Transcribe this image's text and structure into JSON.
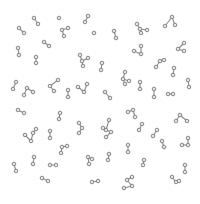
{
  "image": {
    "width": 200,
    "height": 204,
    "background": "#ffffff",
    "description": "Scattered ball-and-stick molecule glyphs on a white background",
    "colors": {
      "atom_fill": "#e6e6e6",
      "atom_stroke": "#7a7a7a",
      "bond": "#8a8a8a"
    },
    "atom_radius": 1.8
  },
  "molecules": [
    {
      "atoms": [
        [
          34,
          18
        ],
        [
          38,
          24
        ]
      ],
      "bonds": [
        [
          0,
          1
        ]
      ]
    },
    {
      "atoms": [
        [
          19,
          28
        ],
        [
          24,
          33
        ]
      ],
      "bonds": [
        [
          0,
          1
        ]
      ]
    },
    {
      "atoms": [
        [
          59,
          18
        ]
      ],
      "bonds": []
    },
    {
      "atoms": [
        [
          62,
          30
        ],
        [
          68,
          28
        ],
        [
          64,
          36
        ]
      ],
      "bonds": [
        [
          0,
          1
        ],
        [
          0,
          2
        ]
      ]
    },
    {
      "atoms": [
        [
          88,
          16
        ],
        [
          85,
          22
        ]
      ],
      "bonds": [
        [
          0,
          1
        ]
      ]
    },
    {
      "atoms": [
        [
          94,
          33
        ]
      ],
      "bonds": []
    },
    {
      "atoms": [
        [
          44,
          42
        ],
        [
          49,
          46
        ]
      ],
      "bonds": [
        [
          0,
          1
        ]
      ]
    },
    {
      "atoms": [
        [
          18,
          48
        ],
        [
          19,
          55
        ]
      ],
      "bonds": [
        [
          0,
          1
        ]
      ]
    },
    {
      "atoms": [
        [
          36,
          57
        ],
        [
          36,
          63
        ]
      ],
      "bonds": [
        [
          0,
          1
        ]
      ]
    },
    {
      "atoms": [
        [
          82,
          61
        ],
        [
          80,
          55
        ],
        [
          88,
          58
        ],
        [
          83,
          66
        ]
      ],
      "bonds": [
        [
          0,
          1
        ],
        [
          0,
          2
        ],
        [
          0,
          3
        ]
      ]
    },
    {
      "atoms": [
        [
          16,
          82
        ],
        [
          13,
          89
        ]
      ],
      "bonds": [
        [
          0,
          1
        ]
      ]
    },
    {
      "atoms": [
        [
          27,
          88
        ],
        [
          24,
          95
        ],
        [
          33,
          92
        ]
      ],
      "bonds": [
        [
          0,
          1
        ],
        [
          0,
          2
        ]
      ]
    },
    {
      "atoms": [
        [
          50,
          86
        ],
        [
          58,
          80
        ],
        [
          54,
          91
        ]
      ],
      "bonds": [
        [
          0,
          1
        ],
        [
          0,
          2
        ]
      ]
    },
    {
      "atoms": [
        [
          68,
          90
        ],
        [
          68,
          97
        ]
      ],
      "bonds": [
        [
          0,
          1
        ]
      ]
    },
    {
      "atoms": [
        [
          78,
          87
        ],
        [
          84,
          92
        ],
        [
          87,
          84
        ]
      ],
      "bonds": [
        [
          0,
          1
        ],
        [
          1,
          2
        ]
      ]
    },
    {
      "atoms": [
        [
          114,
          31
        ],
        [
          116,
          38
        ]
      ],
      "bonds": [
        [
          0,
          1
        ]
      ]
    },
    {
      "atoms": [
        [
          140,
          29
        ],
        [
          137,
          24
        ],
        [
          147,
          30
        ],
        [
          141,
          33
        ]
      ],
      "bonds": [
        [
          0,
          1
        ],
        [
          0,
          2
        ],
        [
          0,
          3
        ]
      ]
    },
    {
      "atoms": [
        [
          172,
          17
        ],
        [
          165,
          26
        ],
        [
          175,
          25
        ]
      ],
      "bonds": [
        [
          0,
          1
        ],
        [
          0,
          2
        ]
      ]
    },
    {
      "atoms": [
        [
          141,
          54
        ],
        [
          134,
          51
        ],
        [
          141,
          46
        ]
      ],
      "bonds": [
        [
          0,
          1
        ],
        [
          0,
          2
        ]
      ]
    },
    {
      "atoms": [
        [
          184,
          43
        ],
        [
          178,
          49
        ],
        [
          184,
          51
        ]
      ],
      "bonds": [
        [
          0,
          1
        ],
        [
          1,
          2
        ]
      ]
    },
    {
      "atoms": [
        [
          160,
          61
        ],
        [
          164,
          60
        ],
        [
          156,
          67
        ]
      ],
      "bonds": [
        [
          0,
          1
        ],
        [
          0,
          2
        ]
      ]
    },
    {
      "atoms": [
        [
          102,
          63
        ],
        [
          101,
          70
        ]
      ],
      "bonds": [
        [
          0,
          1
        ]
      ]
    },
    {
      "atoms": [
        [
          125,
          72
        ],
        [
          123,
          79
        ],
        [
          129,
          81
        ],
        [
          125,
          84
        ]
      ],
      "bonds": [
        [
          0,
          1
        ],
        [
          1,
          2
        ],
        [
          1,
          3
        ]
      ]
    },
    {
      "atoms": [
        [
          140,
          82
        ],
        [
          140,
          89
        ]
      ],
      "bonds": [
        [
          0,
          1
        ]
      ]
    },
    {
      "atoms": [
        [
          174,
          68
        ],
        [
          173,
          75
        ]
      ],
      "bonds": [
        [
          0,
          1
        ]
      ]
    },
    {
      "atoms": [
        [
          188,
          80
        ],
        [
          189,
          87
        ]
      ],
      "bonds": [
        [
          0,
          1
        ]
      ]
    },
    {
      "atoms": [
        [
          105,
          92
        ],
        [
          110,
          98
        ]
      ],
      "bonds": [
        [
          0,
          1
        ]
      ]
    },
    {
      "atoms": [
        [
          154,
          89
        ],
        [
          154,
          97
        ]
      ],
      "bonds": [
        [
          0,
          1
        ]
      ]
    },
    {
      "atoms": [
        [
          168,
          94
        ],
        [
          173,
          94
        ]
      ],
      "bonds": [
        [
          0,
          1
        ]
      ]
    },
    {
      "atoms": [
        [
          18,
          110
        ],
        [
          24,
          113
        ]
      ],
      "bonds": [
        [
          0,
          1
        ]
      ]
    },
    {
      "atoms": [
        [
          60,
          113
        ],
        [
          59,
          119
        ]
      ],
      "bonds": [
        [
          0,
          1
        ]
      ]
    },
    {
      "atoms": [
        [
          79,
          123
        ],
        [
          82,
          128
        ],
        [
          79,
          133
        ]
      ],
      "bonds": [
        [
          0,
          1
        ],
        [
          1,
          2
        ]
      ]
    },
    {
      "atoms": [
        [
          31,
          141
        ],
        [
          25,
          135
        ],
        [
          33,
          133
        ],
        [
          36,
          129
        ]
      ],
      "bonds": [
        [
          0,
          1
        ],
        [
          0,
          2
        ],
        [
          2,
          3
        ]
      ]
    },
    {
      "atoms": [
        [
          50,
          131
        ],
        [
          50,
          138
        ]
      ],
      "bonds": [
        [
          0,
          1
        ]
      ]
    },
    {
      "atoms": [
        [
          62,
          147
        ],
        [
          67,
          146
        ],
        [
          61,
          153
        ]
      ],
      "bonds": [
        [
          0,
          1
        ],
        [
          0,
          2
        ]
      ]
    },
    {
      "atoms": [
        [
          14,
          164
        ],
        [
          16,
          171
        ]
      ],
      "bonds": [
        [
          0,
          1
        ]
      ]
    },
    {
      "atoms": [
        [
          34,
          157
        ],
        [
          33,
          164
        ]
      ],
      "bonds": [
        [
          0,
          1
        ]
      ]
    },
    {
      "atoms": [
        [
          50,
          165
        ],
        [
          56,
          165
        ]
      ],
      "bonds": [
        [
          0,
          1
        ]
      ]
    },
    {
      "atoms": [
        [
          88,
          157
        ],
        [
          92,
          159
        ],
        [
          89,
          164
        ]
      ],
      "bonds": [
        [
          0,
          1
        ],
        [
          0,
          2
        ]
      ]
    },
    {
      "atoms": [
        [
          42,
          178
        ],
        [
          48,
          181
        ]
      ],
      "bonds": [
        [
          0,
          1
        ]
      ]
    },
    {
      "atoms": [
        [
          92,
          182
        ],
        [
          98,
          181
        ]
      ],
      "bonds": [
        [
          0,
          1
        ]
      ]
    },
    {
      "atoms": [
        [
          128,
          112
        ],
        [
          133,
          110
        ],
        [
          135,
          117
        ]
      ],
      "bonds": [
        [
          0,
          1
        ],
        [
          1,
          2
        ]
      ]
    },
    {
      "atoms": [
        [
          106,
          130
        ],
        [
          109,
          120
        ],
        [
          103,
          128
        ],
        [
          111,
          132
        ],
        [
          106,
          137
        ]
      ],
      "bonds": [
        [
          0,
          1
        ],
        [
          0,
          2
        ],
        [
          0,
          3
        ],
        [
          3,
          4
        ]
      ]
    },
    {
      "atoms": [
        [
          180,
          115
        ],
        [
          176,
          121
        ],
        [
          187,
          121
        ]
      ],
      "bonds": [
        [
          0,
          1
        ],
        [
          0,
          2
        ]
      ]
    },
    {
      "atoms": [
        [
          142,
          124
        ],
        [
          139,
          130
        ]
      ],
      "bonds": [
        [
          0,
          1
        ]
      ]
    },
    {
      "atoms": [
        [
          157,
          130
        ],
        [
          153,
          136
        ]
      ],
      "bonds": [
        [
          0,
          1
        ]
      ]
    },
    {
      "atoms": [
        [
          162,
          141
        ],
        [
          164,
          147
        ]
      ],
      "bonds": [
        [
          0,
          1
        ]
      ]
    },
    {
      "atoms": [
        [
          188,
          145
        ],
        [
          188,
          138
        ],
        [
          182,
          145
        ]
      ],
      "bonds": [
        [
          0,
          1
        ],
        [
          0,
          2
        ]
      ]
    },
    {
      "atoms": [
        [
          128,
          145
        ],
        [
          128,
          152
        ]
      ],
      "bonds": [
        [
          0,
          1
        ]
      ]
    },
    {
      "atoms": [
        [
          109,
          154
        ],
        [
          108,
          160
        ]
      ],
      "bonds": [
        [
          0,
          1
        ]
      ]
    },
    {
      "atoms": [
        [
          144,
          160
        ],
        [
          143,
          165
        ]
      ],
      "bonds": [
        [
          0,
          1
        ]
      ]
    },
    {
      "atoms": [
        [
          185,
          165
        ],
        [
          185,
          172
        ]
      ],
      "bonds": [
        [
          0,
          1
        ]
      ]
    },
    {
      "atoms": [
        [
          127,
          180
        ],
        [
          132,
          177
        ],
        [
          132,
          186
        ],
        [
          124,
          188
        ]
      ],
      "bonds": [
        [
          0,
          1
        ],
        [
          0,
          2
        ],
        [
          2,
          3
        ]
      ]
    },
    {
      "atoms": [
        [
          172,
          177
        ],
        [
          176,
          182
        ],
        [
          179,
          181
        ]
      ],
      "bonds": [
        [
          0,
          1
        ],
        [
          1,
          2
        ]
      ]
    }
  ]
}
